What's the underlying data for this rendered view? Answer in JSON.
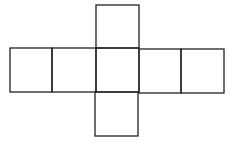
{
  "diagram": {
    "type": "net",
    "stroke_color": "#222222",
    "background": "#ffffff",
    "squares": [
      {
        "id": "top",
        "x": 96,
        "y": 5,
        "w": 43,
        "h": 43
      },
      {
        "id": "row-1",
        "x": 10,
        "y": 48,
        "w": 42,
        "h": 44
      },
      {
        "id": "row-2",
        "x": 52,
        "y": 48,
        "w": 44,
        "h": 44
      },
      {
        "id": "row-3-center",
        "x": 96,
        "y": 48,
        "w": 43,
        "h": 44
      },
      {
        "id": "row-4",
        "x": 139,
        "y": 49,
        "w": 42,
        "h": 44
      },
      {
        "id": "row-5",
        "x": 181,
        "y": 49,
        "w": 43,
        "h": 44
      },
      {
        "id": "bottom",
        "x": 95,
        "y": 92,
        "w": 43,
        "h": 44
      }
    ]
  }
}
